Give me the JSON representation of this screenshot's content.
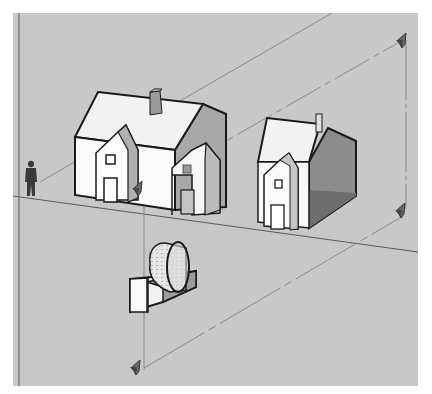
{
  "viewport": {
    "label": "3D modeling viewport",
    "background_color": "#c8c8c8",
    "edge_color": "#1a1a1a",
    "guide_line_color": "#8a8a8a"
  },
  "scene": {
    "objects": [
      {
        "id": "house-large",
        "label": "Large house",
        "wall_color": "#fafafa",
        "roof_color": "#f0f0f0",
        "shadow_color": "#9a9a9a"
      },
      {
        "id": "house-small",
        "label": "Small house (sectioned)",
        "wall_color": "#f5f5f5",
        "cut_color": "#8c8c8c"
      },
      {
        "id": "human-figure",
        "label": "Scale figure",
        "color": "#3a3a3a"
      },
      {
        "id": "cylinder-block",
        "label": "Cylinder on block",
        "surface_color": "#e2e2e2",
        "cut_color": "#9c9c9c"
      }
    ],
    "section_planes": [
      {
        "id": "section-plane-top-right",
        "label": "Section plane marker"
      },
      {
        "id": "section-plane-middle-right",
        "label": "Section plane marker"
      },
      {
        "id": "section-plane-center",
        "label": "Section plane marker"
      },
      {
        "id": "section-plane-bottom-left",
        "label": "Section plane marker"
      }
    ]
  }
}
